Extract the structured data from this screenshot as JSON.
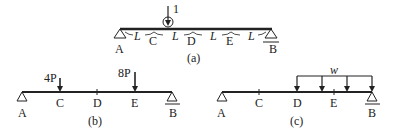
{
  "figure_a": {
    "caption": "(a)",
    "points": [
      "A",
      "C",
      "D",
      "E",
      "B"
    ],
    "segment_label": "L",
    "load_label": "1",
    "segments": [
      "L",
      "L",
      "L",
      "L",
      "L"
    ]
  },
  "figure_b": {
    "caption": "(b)",
    "points": [
      "A",
      "C",
      "D",
      "E",
      "B"
    ],
    "loads": [
      {
        "label": "4P",
        "at": "C"
      },
      {
        "label": "8P",
        "at": "E"
      }
    ]
  },
  "figure_c": {
    "caption": "(c)",
    "points": [
      "A",
      "C",
      "D",
      "E",
      "B"
    ],
    "distributed_load": {
      "label": "w",
      "from": "D",
      "to": "B"
    }
  },
  "colors": {
    "ink": "#222222",
    "background": "#ffffff"
  }
}
